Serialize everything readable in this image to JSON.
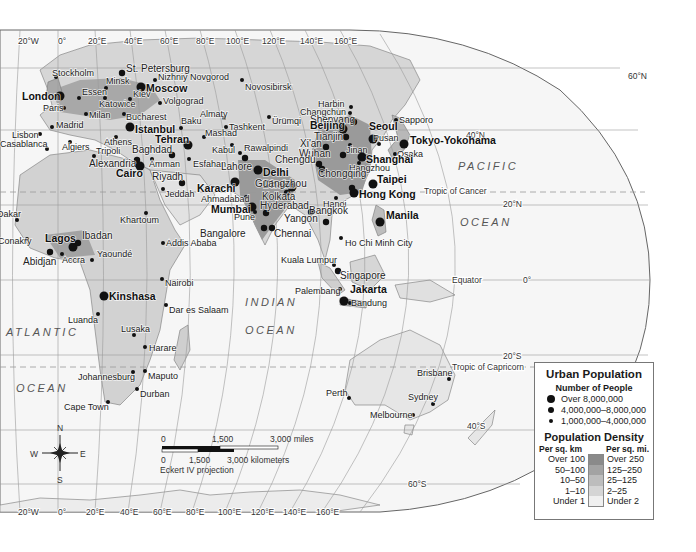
{
  "map": {
    "projection": "Eckert IV projection",
    "oceans": [
      {
        "name": "PACIFIC",
        "x": 458,
        "y": 170
      },
      {
        "name": "OCEAN",
        "x": 460,
        "y": 226
      },
      {
        "name": "ATLANTIC",
        "x": 6,
        "y": 336
      },
      {
        "name": "OCEAN",
        "x": 16,
        "y": 392
      },
      {
        "name": "INDIAN",
        "x": 245,
        "y": 306
      },
      {
        "name": "OCEAN",
        "x": 245,
        "y": 334
      }
    ],
    "graticule": {
      "top_longitudes": [
        {
          "label": "20°W",
          "x": 18,
          "y": 44
        },
        {
          "label": "0°",
          "x": 58,
          "y": 44
        },
        {
          "label": "20°E",
          "x": 88,
          "y": 44
        },
        {
          "label": "40°E",
          "x": 124,
          "y": 44
        },
        {
          "label": "60°E",
          "x": 160,
          "y": 44
        },
        {
          "label": "80°E",
          "x": 196,
          "y": 44
        },
        {
          "label": "100°E",
          "x": 226,
          "y": 44
        },
        {
          "label": "120°E",
          "x": 262,
          "y": 44
        },
        {
          "label": "140°E",
          "x": 300,
          "y": 44
        },
        {
          "label": "160°E",
          "x": 334,
          "y": 44
        }
      ],
      "bottom_longitudes": [
        {
          "label": "20°W",
          "x": 18,
          "y": 515
        },
        {
          "label": "0°",
          "x": 58,
          "y": 515
        },
        {
          "label": "20°E",
          "x": 86,
          "y": 515
        },
        {
          "label": "40°E",
          "x": 120,
          "y": 515
        },
        {
          "label": "60°E",
          "x": 153,
          "y": 515
        },
        {
          "label": "80°E",
          "x": 186,
          "y": 515
        },
        {
          "label": "100°E",
          "x": 218,
          "y": 515
        },
        {
          "label": "120°E",
          "x": 251,
          "y": 515
        },
        {
          "label": "140°E",
          "x": 283,
          "y": 515
        },
        {
          "label": "160°E",
          "x": 316,
          "y": 515
        }
      ],
      "latitudes": [
        {
          "label": "60°N",
          "x": 628,
          "y": 76
        },
        {
          "label": "40°N",
          "x": 466,
          "y": 135
        },
        {
          "label": "20°N",
          "x": 503,
          "y": 204
        },
        {
          "label": "0°",
          "x": 523,
          "y": 280
        },
        {
          "label": "20°S",
          "x": 503,
          "y": 356
        },
        {
          "label": "40°S",
          "x": 467,
          "y": 426
        },
        {
          "label": "60°S",
          "x": 408,
          "y": 484
        }
      ],
      "special_lines": [
        {
          "label": "Tropic of Cancer",
          "x": 424,
          "y": 191
        },
        {
          "label": "Equator",
          "x": 452,
          "y": 280
        },
        {
          "label": "Tropic of Capricorn",
          "x": 452,
          "y": 367
        }
      ]
    },
    "cities": [
      {
        "name": "Stockholm",
        "x": 56,
        "y": 77,
        "size": "small",
        "dx": -4,
        "dy": -1
      },
      {
        "name": "St. Petersburg",
        "x": 122,
        "y": 73,
        "size": "medium",
        "dx": 4,
        "dy": -1
      },
      {
        "name": "Minsk",
        "x": 106,
        "y": 88,
        "size": "small",
        "dx": 0,
        "dy": -4
      },
      {
        "name": "Nizhniy Novgorod",
        "x": 155,
        "y": 80,
        "size": "small",
        "dx": 3,
        "dy": 0
      },
      {
        "name": "Moscow",
        "x": 141,
        "y": 87,
        "size": "large",
        "dx": 5,
        "dy": 5
      },
      {
        "name": "London",
        "x": 60,
        "y": 96,
        "size": "large",
        "dx": -38,
        "dy": 4
      },
      {
        "name": "Essen",
        "x": 79,
        "y": 98,
        "size": "small",
        "dx": 3,
        "dy": -3
      },
      {
        "name": "Katowice",
        "x": 105,
        "y": 98,
        "size": "small",
        "dx": -6,
        "dy": 9
      },
      {
        "name": "Kiev",
        "x": 130,
        "y": 99,
        "size": "small",
        "dx": 3,
        "dy": -2
      },
      {
        "name": "Volgograd",
        "x": 160,
        "y": 103,
        "size": "small",
        "dx": 3,
        "dy": 1
      },
      {
        "name": "Paris",
        "x": 64,
        "y": 108,
        "size": "small",
        "dx": -21,
        "dy": 3
      },
      {
        "name": "Milan",
        "x": 86,
        "y": 114,
        "size": "small",
        "dx": 3,
        "dy": 4
      },
      {
        "name": "Bucharest",
        "x": 124,
        "y": 114,
        "size": "small",
        "dx": 2,
        "dy": 6
      },
      {
        "name": "Almaty",
        "x": 224,
        "y": 118,
        "size": "small",
        "dx": -24,
        "dy": -1
      },
      {
        "name": "Madrid",
        "x": 52,
        "y": 127,
        "size": "small",
        "dx": 4,
        "dy": 1
      },
      {
        "name": "Istanbul",
        "x": 130,
        "y": 127,
        "size": "large",
        "dx": 5,
        "dy": 6
      },
      {
        "name": "Baku",
        "x": 181,
        "y": 128,
        "size": "small",
        "dx": 0,
        "dy": -4
      },
      {
        "name": "Tashkent",
        "x": 226,
        "y": 127,
        "size": "small",
        "dx": 3,
        "dy": 3
      },
      {
        "name": "Lisbon",
        "x": 40,
        "y": 134,
        "size": "small",
        "dx": -28,
        "dy": 4
      },
      {
        "name": "Mashad",
        "x": 204,
        "y": 137,
        "size": "small",
        "dx": 1,
        "dy": -1
      },
      {
        "name": "Casablanca",
        "x": 47,
        "y": 149,
        "size": "small",
        "dx": -47,
        "dy": -2
      },
      {
        "name": "Algiers",
        "x": 70,
        "y": 142,
        "size": "small",
        "dx": -8,
        "dy": 8
      },
      {
        "name": "Athens",
        "x": 116,
        "y": 137,
        "size": "small",
        "dx": -12,
        "dy": 8
      },
      {
        "name": "Tehran",
        "x": 188,
        "y": 145,
        "size": "large",
        "dx": -33,
        "dy": -2
      },
      {
        "name": "Kabul",
        "x": 232,
        "y": 145,
        "size": "small",
        "dx": -20,
        "dy": 8
      },
      {
        "name": "Tripoli",
        "x": 94,
        "y": 156,
        "size": "small",
        "dx": 2,
        "dy": -2
      },
      {
        "name": "Baghdad",
        "x": 172,
        "y": 155,
        "size": "medium",
        "dx": -40,
        "dy": -2
      },
      {
        "name": "Alexandria",
        "x": 137,
        "y": 160,
        "size": "medium",
        "dx": -48,
        "dy": 7
      },
      {
        "name": "Cairo",
        "x": 140,
        "y": 166,
        "size": "large",
        "dx": -24,
        "dy": 11
      },
      {
        "name": "Amman",
        "x": 152,
        "y": 159,
        "size": "small",
        "dx": -3,
        "dy": 8
      },
      {
        "name": "Esfahan",
        "x": 189,
        "y": 159,
        "size": "small",
        "dx": 4,
        "dy": 8
      },
      {
        "name": "Riyadh",
        "x": 182,
        "y": 183,
        "size": "medium",
        "dx": -30,
        "dy": -3
      },
      {
        "name": "Jeddah",
        "x": 163,
        "y": 189,
        "size": "small",
        "dx": 2,
        "dy": 8
      },
      {
        "name": "Novosibirsk",
        "x": 242,
        "y": 80,
        "size": "small",
        "dx": 3,
        "dy": 10
      },
      {
        "name": "Ürümqi",
        "x": 269,
        "y": 117,
        "size": "small",
        "dx": 3,
        "dy": 7
      },
      {
        "name": "Rawalpindi",
        "x": 240,
        "y": 153,
        "size": "small",
        "dx": 4,
        "dy": -2
      },
      {
        "name": "Lahore",
        "x": 245,
        "y": 158,
        "size": "medium",
        "dx": -24,
        "dy": 12
      },
      {
        "name": "Delhi",
        "x": 258,
        "y": 170,
        "size": "large",
        "dx": 5,
        "dy": 6
      },
      {
        "name": "Karachi",
        "x": 235,
        "y": 182,
        "size": "large",
        "dx": -38,
        "dy": 10
      },
      {
        "name": "Ahmadabad",
        "x": 246,
        "y": 197,
        "size": "small",
        "dx": -45,
        "dy": 5
      },
      {
        "name": "Dhaka",
        "x": 292,
        "y": 187,
        "size": "large",
        "dx": -29,
        "dy": 1
      },
      {
        "name": "Kolkata",
        "x": 287,
        "y": 193,
        "size": "medium",
        "dx": -25,
        "dy": 7
      },
      {
        "name": "Mumbai",
        "x": 252,
        "y": 207,
        "size": "large",
        "dx": -41,
        "dy": 6
      },
      {
        "name": "Pune",
        "x": 255,
        "y": 212,
        "size": "small",
        "dx": -21,
        "dy": 8
      },
      {
        "name": "Hyderabad",
        "x": 266,
        "y": 213,
        "size": "medium",
        "dx": -6,
        "dy": -4
      },
      {
        "name": "Yangon",
        "x": 311,
        "y": 212,
        "size": "medium",
        "dx": -27,
        "dy": 10
      },
      {
        "name": "Bangalore",
        "x": 264,
        "y": 228,
        "size": "medium",
        "dx": -64,
        "dy": 9
      },
      {
        "name": "Chennai",
        "x": 272,
        "y": 228,
        "size": "medium",
        "dx": 2,
        "dy": 9
      },
      {
        "name": "Harbin",
        "x": 351,
        "y": 107,
        "size": "small",
        "dx": -33,
        "dy": 0
      },
      {
        "name": "Changchun",
        "x": 350,
        "y": 113,
        "size": "small",
        "dx": -50,
        "dy": 2
      },
      {
        "name": "Shenyang",
        "x": 354,
        "y": 122,
        "size": "medium",
        "dx": -44,
        "dy": 1
      },
      {
        "name": "Sapporo",
        "x": 396,
        "y": 120,
        "size": "small",
        "dx": 3,
        "dy": 3
      },
      {
        "name": "Beijing",
        "x": 343,
        "y": 129,
        "size": "large",
        "dx": -33,
        "dy": 0
      },
      {
        "name": "Tianjin",
        "x": 346,
        "y": 137,
        "size": "medium",
        "dx": -32,
        "dy": 3
      },
      {
        "name": "Seoul",
        "x": 373,
        "y": 139,
        "size": "large",
        "dx": -4,
        "dy": -9
      },
      {
        "name": "Pusan",
        "x": 379,
        "y": 144,
        "size": "small",
        "dx": -6,
        "dy": -3
      },
      {
        "name": "Tokyo-Yokohama",
        "x": 404,
        "y": 144,
        "size": "large",
        "dx": 6,
        "dy": 0
      },
      {
        "name": "Jinan",
        "x": 350,
        "y": 145,
        "size": "small",
        "dx": -4,
        "dy": 8
      },
      {
        "name": "Xi'an",
        "x": 326,
        "y": 147,
        "size": "medium",
        "dx": -26,
        "dy": 0
      },
      {
        "name": "Osaka",
        "x": 395,
        "y": 154,
        "size": "small",
        "dx": 2,
        "dy": 3
      },
      {
        "name": "Wuhan",
        "x": 343,
        "y": 155,
        "size": "medium",
        "dx": -44,
        "dy": 2
      },
      {
        "name": "Shanghai",
        "x": 362,
        "y": 157,
        "size": "large",
        "dx": 4,
        "dy": 6
      },
      {
        "name": "Chengdu",
        "x": 319,
        "y": 164,
        "size": "medium",
        "dx": -44,
        "dy": -1
      },
      {
        "name": "Hangzhou",
        "x": 359,
        "y": 163,
        "size": "small",
        "dx": -10,
        "dy": 8
      },
      {
        "name": "Chongqing",
        "x": 322,
        "y": 169,
        "size": "medium",
        "dx": -4,
        "dy": 8
      },
      {
        "name": "Taipei",
        "x": 373,
        "y": 184,
        "size": "large",
        "dx": 4,
        "dy": -1
      },
      {
        "name": "Guangzhou",
        "x": 352,
        "y": 188,
        "size": "medium",
        "dx": -97,
        "dy": -1
      },
      {
        "name": "Hong Kong",
        "x": 354,
        "y": 193,
        "size": "large",
        "dx": 5,
        "dy": 5
      },
      {
        "name": "Hanoi",
        "x": 336,
        "y": 198,
        "size": "small",
        "dx": -13,
        "dy": 9
      },
      {
        "name": "Manila",
        "x": 380,
        "y": 222,
        "size": "large",
        "dx": 6,
        "dy": -3
      },
      {
        "name": "Bangkok",
        "x": 326,
        "y": 222,
        "size": "medium",
        "dx": -17,
        "dy": -8
      },
      {
        "name": "Ho Chi Minh City",
        "x": 341,
        "y": 238,
        "size": "small",
        "dx": 4,
        "dy": 8
      },
      {
        "name": "Kuala Lumpur",
        "x": 334,
        "y": 265,
        "size": "small",
        "dx": -53,
        "dy": -2
      },
      {
        "name": "Singapore",
        "x": 338,
        "y": 271,
        "size": "medium",
        "dx": 2,
        "dy": 8
      },
      {
        "name": "Palembang",
        "x": 340,
        "y": 289,
        "size": "small",
        "dx": -45,
        "dy": 5
      },
      {
        "name": "Jakarta",
        "x": 344,
        "y": 301,
        "size": "large",
        "dx": 6,
        "dy": -8
      },
      {
        "name": "Bandung",
        "x": 350,
        "y": 303,
        "size": "small",
        "dx": 1,
        "dy": 3
      },
      {
        "name": "Dakar",
        "x": 17,
        "y": 220,
        "size": "small",
        "dx": -20,
        "dy": -3
      },
      {
        "name": "Conakry",
        "x": 27,
        "y": 239,
        "size": "small",
        "dx": -29,
        "dy": 5
      },
      {
        "name": "Lagos",
        "x": 73,
        "y": 247,
        "size": "large",
        "dx": -28,
        "dy": -5
      },
      {
        "name": "Ibadan",
        "x": 78,
        "y": 243,
        "size": "medium",
        "dx": 4,
        "dy": -4
      },
      {
        "name": "Abidjan",
        "x": 50,
        "y": 252,
        "size": "medium",
        "dx": -27,
        "dy": 13
      },
      {
        "name": "Accra",
        "x": 62,
        "y": 254,
        "size": "small",
        "dx": 0,
        "dy": 9
      },
      {
        "name": "Yaoundé",
        "x": 92,
        "y": 260,
        "size": "small",
        "dx": 5,
        "dy": -3
      },
      {
        "name": "Khartoum",
        "x": 146,
        "y": 213,
        "size": "small",
        "dx": -26,
        "dy": 10
      },
      {
        "name": "Addis Ababa",
        "x": 163,
        "y": 243,
        "size": "small",
        "dx": 3,
        "dy": 3
      },
      {
        "name": "Nairobi",
        "x": 162,
        "y": 279,
        "size": "small",
        "dx": 3,
        "dy": 7
      },
      {
        "name": "Kinshasa",
        "x": 104,
        "y": 296,
        "size": "large",
        "dx": 5,
        "dy": 4
      },
      {
        "name": "Dar es Salaam",
        "x": 166,
        "y": 305,
        "size": "small",
        "dx": 3,
        "dy": 8
      },
      {
        "name": "Luanda",
        "x": 98,
        "y": 314,
        "size": "small",
        "dx": -30,
        "dy": 9
      },
      {
        "name": "Lusaka",
        "x": 134,
        "y": 335,
        "size": "small",
        "dx": -13,
        "dy": -3
      },
      {
        "name": "Harare",
        "x": 145,
        "y": 347,
        "size": "small",
        "dx": 4,
        "dy": 4
      },
      {
        "name": "Johannesburg",
        "x": 133,
        "y": 372,
        "size": "small",
        "dx": -55,
        "dy": 8
      },
      {
        "name": "Maputo",
        "x": 145,
        "y": 371,
        "size": "small",
        "dx": 3,
        "dy": 8
      },
      {
        "name": "Durban",
        "x": 137,
        "y": 389,
        "size": "small",
        "dx": 3,
        "dy": 8
      },
      {
        "name": "Cape Town",
        "x": 108,
        "y": 402,
        "size": "small",
        "dx": -44,
        "dy": 8
      },
      {
        "name": "Perth",
        "x": 349,
        "y": 398,
        "size": "small",
        "dx": -23,
        "dy": -2
      },
      {
        "name": "Brisbane",
        "x": 449,
        "y": 379,
        "size": "small",
        "dx": -32,
        "dy": -3
      },
      {
        "name": "Sydney",
        "x": 433,
        "y": 404,
        "size": "small",
        "dx": -25,
        "dy": -4
      },
      {
        "name": "Melbourne",
        "x": 413,
        "y": 415,
        "size": "small",
        "dx": -43,
        "dy": 3
      }
    ],
    "compass": {
      "n": "N",
      "s": "S",
      "e": "E",
      "w": "W"
    },
    "scale_bar": {
      "miles_labels": [
        "0",
        "1,500",
        "3,000 miles"
      ],
      "km_labels": [
        "0",
        "1,500",
        "3,000 kilometers"
      ]
    }
  },
  "legend": {
    "title": "Urban Population",
    "subtitle": "Number of People",
    "population_classes": [
      {
        "label": "Over 8,000,000",
        "size": 8
      },
      {
        "label": "4,000,000–8,000,000",
        "size": 6
      },
      {
        "label": "1,000,000–4,000,000",
        "size": 4
      }
    ],
    "density_title": "Population Density",
    "density_head_left": "Per sq. km",
    "density_head_right": "Per sq. mi.",
    "density_classes": [
      {
        "km": "Over 100",
        "mi": "Over 250",
        "color": "#8a8a8a"
      },
      {
        "km": "50–100",
        "mi": "125–250",
        "color": "#a3a3a3"
      },
      {
        "km": "10–50",
        "mi": "25–125",
        "color": "#bdbdbd"
      },
      {
        "km": "1–10",
        "mi": "2–25",
        "color": "#d5d5d5"
      },
      {
        "km": "Under 1",
        "mi": "Under 2",
        "color": "#f0f0f0"
      }
    ]
  },
  "colors": {
    "ocean": "#f6f6f6",
    "land_low": "#e4e4e4",
    "land_mid": "#cfcfcf",
    "land_high": "#a6a6a6",
    "border": "#555555",
    "graticule": "#9a9a9a",
    "city": "#111111"
  }
}
